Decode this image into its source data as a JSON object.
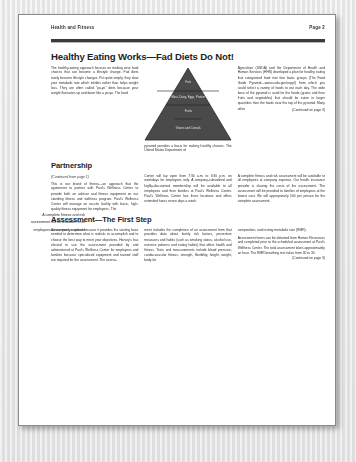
{
  "document": {
    "running_header_left": "Health and Fitness",
    "running_header_right": "Page 2",
    "headline": "Healthy Eating Works—Fad Diets Do Not!",
    "section_partnership": "Partnership",
    "section_partnership_note": "(Continued from page 1)",
    "section_assessment": "Assessment—The First Step",
    "continued_note": "(Continued on page 3)"
  },
  "sidebar": {
    "pullquote": "A complete fitness and risk assessment will be available to all employees at company expense"
  },
  "figure": {
    "name": "food-pyramid",
    "tiers": [
      "Fats",
      "Meat, Dairy, Eggs, Protein",
      "Fruits",
      "Grains and Cereals"
    ],
    "fill_color": "#4a4a4a"
  },
  "article": {
    "top": {
      "col1": [
        "The healthy-eating approach focuses on making wise food choices that can become a lifestyle change. Fad diets rarely become lifestyle changes. Put quite simply, they slow your metabolic rate which inhibits rather than helps weight loss. They are often called \"yo-yo\" diets because your weight fluctuates up and down like a yo-yo. The food"
      ],
      "col2": [
        "pyramid provides a basis for making healthy choices. The United States Department of"
      ],
      "col3": [
        "Agriculture (USDA) and the Department of Health and Human Services (HHS) developed a plan for healthy eating that categorized food into four basic groups (The Food Guide Pyramid—www.usda.gov/cnpp/) from which you could select a variety of foods to eat each day. The wide base of the pyramid is used for the foods (grains and then fruits and vegetables) that should be eaten in larger quantities than the foods near the top of the pyramid. Many other"
      ]
    },
    "partnership": {
      "col1": [
        "This is our brand of fitness—an approach that the agreement to partner with Paul's Wellness Center to provide both an advisor and fitness equipment on our standing fitness and wellness program. Paul's Wellness Center will manage an on-site facility with basic, high-quality fitness equipment for employees. The"
      ],
      "col2": [
        "Center will lay open from 7:30 a.m. to 6:30 p.m. on weekdays for employees only. A company-subsidized and highly-discounted membership will be available to all employees and their families at Paul's Wellness Center. Paul's Wellness Center has three locations and offers extended hours seven days a week."
      ],
      "col3": [
        "A complete fitness and risk assessment will be available to all employees at company expense. Our health insurance provider is sharing the costs of the assessment. The assessment will be provided to families of employees at the lowest cost. We will appropriately 500 per person for the complete assessment."
      ]
    },
    "assessment": {
      "col1": [
        "Assessment is critical because it provides the starting base needed to determine what is realistic to accomplish and to choose the best way to meet your objectives. Harvey's has elected to use the assessment provided by and administered at Paul's Wellness Center for employees and families because specialized equipment and trained staff are required for the assessment. The assess-"
      ],
      "col2": [
        "ment includes the completion of an assessment form that provides data about family risk factors, preventive measures and habits (such as smoking status, alcohol use, exercise patterns and eating habits) that affect health and fitness. Tests and measurements include blood pressure, cardio-vascular fitness, strength, flexibility, height, weight, body fat"
      ],
      "col3": [
        "composition, and resting metabolic rate (RMR).",
        "Assessment forms can be obtained from Human Resources and completed prior to the scheduled assessment at Paul's Wellness Center. The total assessment takes approximately an hour. The RMR breathing test takes from 30 to 30"
      ]
    }
  }
}
